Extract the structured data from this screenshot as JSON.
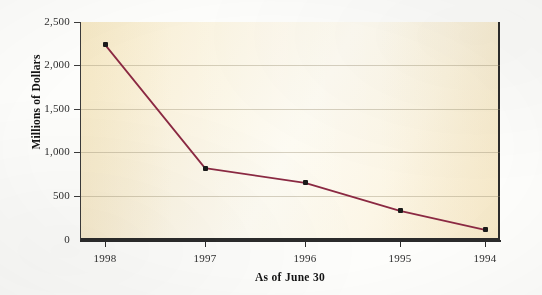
{
  "chart_data": {
    "type": "line",
    "title": "",
    "xlabel": "As of June 30",
    "ylabel": "Millions of Dollars",
    "categories": [
      "1998",
      "1997",
      "1996",
      "1995",
      "1994"
    ],
    "values": [
      2240,
      825,
      655,
      335,
      115
    ],
    "series": [
      {
        "name": "Millions of Dollars",
        "values": [
          2240,
          825,
          655,
          335,
          115
        ]
      }
    ],
    "ylim": [
      0,
      2500
    ],
    "yticks": [
      0,
      500,
      1000,
      1500,
      2000,
      2500
    ],
    "ytick_labels": [
      "0",
      "500",
      "1,000",
      "1,500",
      "2,000",
      "2,500"
    ],
    "xtick_labels": [
      "1998",
      "1997",
      "1996",
      "1995",
      "1994"
    ],
    "grid": true,
    "legend": false,
    "legend_position": "none",
    "line_color": "#8b2942",
    "marker_color": "#1a1a1a",
    "plot_background": "#faf2de",
    "page_background": "#fdfdfb"
  }
}
